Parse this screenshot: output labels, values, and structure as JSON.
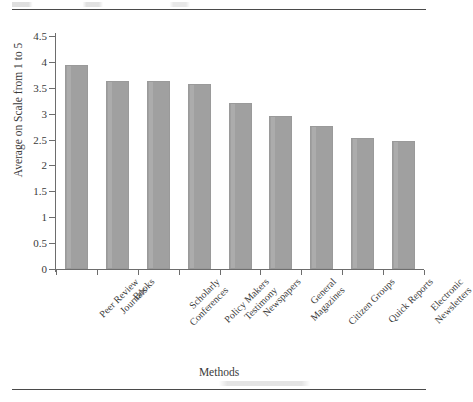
{
  "figure": {
    "has_top_rule": true,
    "has_bottom_rule": true,
    "bar_color": "#a0a0a0",
    "axis_color": "#6d6d6d",
    "text_color": "#3a3a3a",
    "background": "#ffffff"
  },
  "chart_data": {
    "type": "bar",
    "title": "",
    "xlabel": "Methods",
    "ylabel": "Average on Scale from 1 to 5",
    "ylim": [
      0,
      4.5
    ],
    "grid": false,
    "legend": "none",
    "ytick_labels": [
      "4.5",
      "4",
      "3.5",
      "3",
      "2.5",
      "2",
      "1.5",
      "1",
      "0.5",
      "0"
    ],
    "ytick_values": [
      4.5,
      4,
      3.5,
      3,
      2.5,
      2,
      1.5,
      1,
      0.5,
      0
    ],
    "categories": [
      "Peer Review\nJournals",
      "Books",
      "Scholarly\nConferences",
      "Policy Makers\nTestimony",
      "Newspapers",
      "General\nMagazines",
      "Citizen Groups",
      "Quick Reports",
      "Electronic\nNewsletters"
    ],
    "category_labels": [
      [
        "Peer Review",
        "Journals"
      ],
      [
        "Books"
      ],
      [
        "Scholarly",
        "Conferences"
      ],
      [
        "Policy Makers",
        "Testimony"
      ],
      [
        "Newspapers"
      ],
      [
        "General",
        "Magazines"
      ],
      [
        "Citizen Groups"
      ],
      [
        "Quick Reports"
      ],
      [
        "Electronic",
        "Newsletters"
      ]
    ],
    "values": [
      3.94,
      3.64,
      3.64,
      3.57,
      3.2,
      2.95,
      2.76,
      2.54,
      2.47
    ]
  }
}
